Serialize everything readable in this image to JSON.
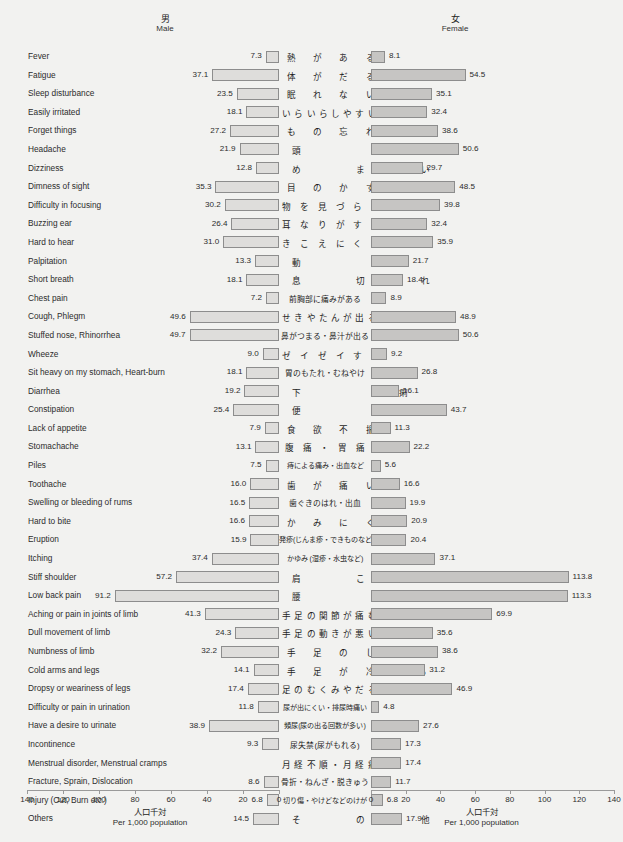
{
  "header": {
    "male_jp": "男",
    "male_en": "Male",
    "female_jp": "女",
    "female_en": "Female"
  },
  "axis": {
    "left_ticks": [
      "140",
      "120",
      "100",
      "80",
      "60",
      "40",
      "20",
      "0"
    ],
    "right_ticks": [
      "0",
      "20",
      "40",
      "60",
      "80",
      "100",
      "120",
      "140"
    ],
    "caption_jp": "人口千対",
    "caption_en": "Per 1,000 population",
    "max": 140,
    "min": 0
  },
  "colors": {
    "male_bar_fill": "#dedddb",
    "female_bar_fill": "#c6c5c3",
    "bar_stroke": "#8d8d8d",
    "background": "#f2f2f0",
    "text": "#2c2c2c"
  },
  "chart_data": {
    "type": "bar",
    "title": "",
    "subtitle": "",
    "orientation": "horizontal-diverging",
    "xlabel": "人口千対 / Per 1,000 population",
    "ylabel": "",
    "xlim": [
      0,
      140
    ],
    "grid": false,
    "legend_position": "top",
    "categories_en": [
      "Fever",
      "Fatigue",
      "Sleep disturbance",
      "Easily irritated",
      "Forget things",
      "Headache",
      "Dizziness",
      "Dimness of sight",
      "Difficulty in focusing",
      "Buzzing ear",
      "Hard to hear",
      "Palpitation",
      "Short breath",
      "Chest pain",
      "Cough, Phlegm",
      "Stuffed nose, Rhinorrhea",
      "Wheeze",
      "Sit heavy on my stomach, Heart-burn",
      "Diarrhea",
      "Constipation",
      "Lack of appetite",
      "Stomachache",
      "Piles",
      "Toothache",
      "Swelling or bleeding of rums",
      "Hard to bite",
      "Eruption",
      "Itching",
      "Stiff shoulder",
      "Low back pain",
      "Aching or pain in joints of limb",
      "Dull movement of limb",
      "Numbness of limb",
      "Cold arms and legs",
      "Dropsy or weariness of legs",
      "Difficulty or pain in urination",
      "Have a desire to urinate",
      "Incontinence",
      "Menstrual disorder, Menstrual cramps",
      "Fracture, Sprain, Dislocation",
      "Injury (Cut, Burn etc.)",
      "Others"
    ],
    "categories_jp": [
      "熱 が あ る",
      "体 が だ る い",
      "眠 れ な い",
      "いらいらしやすい",
      "も の 忘 れ す る",
      "頭　　　　痛",
      "め　　ま　　い",
      "目 の か す み",
      "物 を 見 づ ら い",
      "耳 な り が す る",
      "き こ え に く い",
      "動　　　　悸",
      "息　　切　　れ",
      "前胸部に痛みがある",
      "せきやたんが出る",
      "鼻がつまる・鼻汁が出る",
      "ゼ イ ゼ イ す る",
      "胃のもたれ・むねやけ",
      "下　　　　痢",
      "便　　　　秘",
      "食 欲 不 振",
      "腹 痛 ・ 胃 痛",
      "痔による痛み・出血など",
      "歯 が 痛 い",
      "歯ぐきのはれ・出血",
      "か み に く い",
      "発疹(じんま疹・できものなど)",
      "かゆみ (湿疹・水虫など)",
      "肩　　こ　　り",
      "腰　　　　痛",
      "手足の関節が痛む",
      "手足の動きが悪い",
      "手 足 の し び れ",
      "手 足 が 冷 え る",
      "足のむくみやだるさ",
      "尿が出にくい・排尿時痛い",
      "頻尿(尿の出る回数が多い)",
      "尿失禁(尿がもれる)",
      "月経不順・月経痛",
      "骨折・ねんざ・脱きゅう",
      "切り傷・やけどなどのけが",
      "そ　　の　　他"
    ],
    "series": [
      {
        "name": "男 / Male",
        "values": [
          7.3,
          37.1,
          23.5,
          18.1,
          27.2,
          21.9,
          12.8,
          35.3,
          30.2,
          26.4,
          31.0,
          13.3,
          18.1,
          7.2,
          49.6,
          49.7,
          9.0,
          18.1,
          19.2,
          25.4,
          7.9,
          13.1,
          7.5,
          16.0,
          16.5,
          16.6,
          15.9,
          37.4,
          57.2,
          91.2,
          41.3,
          24.3,
          32.2,
          14.1,
          17.4,
          11.8,
          38.9,
          9.3,
          null,
          8.6,
          6.8,
          14.5
        ]
      },
      {
        "name": "女 / Female",
        "values": [
          8.1,
          54.5,
          35.1,
          32.4,
          38.6,
          50.6,
          29.7,
          48.5,
          39.8,
          32.4,
          35.9,
          21.7,
          18.4,
          8.9,
          48.9,
          50.6,
          9.2,
          26.8,
          16.1,
          43.7,
          11.3,
          22.2,
          5.6,
          16.6,
          19.9,
          20.9,
          20.4,
          37.1,
          113.8,
          113.3,
          69.9,
          35.6,
          38.6,
          31.2,
          46.9,
          4.8,
          27.6,
          17.3,
          17.4,
          11.7,
          6.8,
          17.9
        ]
      }
    ],
    "jp_label_style": [
      "sp2",
      "sp2",
      "sp2",
      "sp",
      "sp2",
      "sp3",
      "sp3",
      "sp2",
      "sp",
      "sp",
      "sp",
      "sp3",
      "sp3",
      "small",
      "sp",
      "small",
      "sp",
      "small",
      "sp3",
      "sp3",
      "sp2",
      "sp",
      "tiny",
      "sp2",
      "small",
      "sp2",
      "tiny",
      "tiny",
      "sp3",
      "sp3",
      "sp",
      "sp",
      "sp2",
      "sp2",
      "sp",
      "tiny",
      "tiny",
      "small",
      "sp",
      "small",
      "tiny",
      "sp3"
    ]
  }
}
